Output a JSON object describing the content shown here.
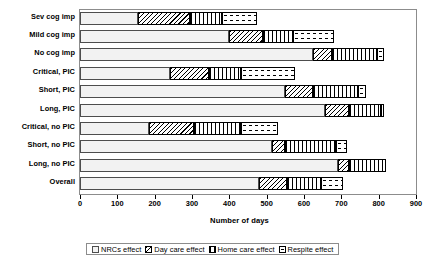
{
  "chart_data": {
    "type": "bar",
    "orientation": "horizontal",
    "stacked": true,
    "title": "",
    "xlabel": "Number of days",
    "ylabel": "",
    "xlim": [
      0,
      900
    ],
    "xticks": [
      0,
      100,
      200,
      300,
      400,
      500,
      600,
      700,
      800,
      900
    ],
    "grid": false,
    "legend_position": "bottom",
    "categories": [
      "Sev cog imp",
      "Mild cog imp",
      "No cog imp",
      "Critical, PIC",
      "Short, PIC",
      "Long, PIC",
      "Critical, no PIC",
      "Short, no PIC",
      "Long, no PIC",
      "Overall"
    ],
    "series": [
      {
        "name": "NRCs effect",
        "pattern": "light-dotted",
        "values": [
          155,
          400,
          625,
          240,
          550,
          655,
          185,
          515,
          690,
          480
        ]
      },
      {
        "name": "Day care effect",
        "pattern": "diagonal-hatch",
        "values": [
          140,
          90,
          50,
          105,
          75,
          65,
          120,
          35,
          30,
          75
        ]
      },
      {
        "name": "Home care effect",
        "pattern": "vertical-stripes",
        "values": [
          85,
          80,
          120,
          85,
          120,
          85,
          125,
          135,
          100,
          90
        ]
      },
      {
        "name": "Respite effect",
        "pattern": "sparse-dots",
        "values": [
          95,
          110,
          20,
          145,
          20,
          10,
          100,
          30,
          0,
          60
        ]
      }
    ],
    "totals": [
      475,
      680,
      815,
      575,
      765,
      815,
      530,
      715,
      820,
      705
    ]
  },
  "legend": {
    "items": [
      {
        "label": "NRCs effect"
      },
      {
        "label": "Day care effect"
      },
      {
        "label": "Home care effect"
      },
      {
        "label": "Respite effect"
      }
    ]
  }
}
